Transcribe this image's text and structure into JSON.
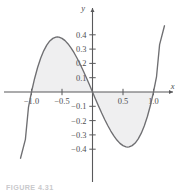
{
  "figure": {
    "caption": "FIGURE 4.31",
    "axis_labels": {
      "x": "x",
      "y": "y"
    },
    "colors": {
      "curve": "#6f6f72",
      "axis": "#59595b",
      "fill": "#efeff0",
      "text": "#4e4e50",
      "background": "#ffffff"
    }
  },
  "chart_data": {
    "type": "line",
    "title": "",
    "xlabel": "x",
    "ylabel": "y",
    "grid": false,
    "legend": null,
    "xlim": [
      -1.18,
      1.18
    ],
    "ylim": [
      -0.52,
      0.5
    ],
    "xticks": [
      -1.0,
      -0.5,
      0.5,
      1.0
    ],
    "xtick_labels": [
      "−1.0",
      "−0.5",
      "0.5",
      "1.0"
    ],
    "yticks": [
      0.4,
      0.3,
      0.2,
      0.1,
      -0.1,
      -0.2,
      -0.3,
      -0.4
    ],
    "ytick_labels": [
      "0.4",
      "0.3",
      "0.2",
      "0.1",
      "−0.1",
      "−0.2",
      "−0.3",
      "−0.4"
    ],
    "series": [
      {
        "name": "y = x³ − x",
        "expression": "x^3 - x",
        "x": [
          -1.18,
          -1.1,
          -1.05,
          -1.0,
          -0.95,
          -0.9,
          -0.85,
          -0.8,
          -0.75,
          -0.7,
          -0.65,
          -0.6,
          -0.577,
          -0.55,
          -0.5,
          -0.45,
          -0.4,
          -0.35,
          -0.3,
          -0.25,
          -0.2,
          -0.15,
          -0.1,
          -0.05,
          0.0,
          0.05,
          0.1,
          0.15,
          0.2,
          0.25,
          0.3,
          0.35,
          0.4,
          0.45,
          0.5,
          0.55,
          0.577,
          0.6,
          0.65,
          0.7,
          0.75,
          0.8,
          0.85,
          0.9,
          0.95,
          1.0,
          1.05,
          1.1,
          1.18
        ],
        "y": [
          -0.463,
          -0.331,
          -0.108,
          0.0,
          0.093,
          0.171,
          0.236,
          0.288,
          0.328,
          0.357,
          0.375,
          0.384,
          0.385,
          0.384,
          0.375,
          0.359,
          0.336,
          0.307,
          0.273,
          0.234,
          0.192,
          0.147,
          0.099,
          0.05,
          0.0,
          -0.05,
          -0.099,
          -0.147,
          -0.192,
          -0.234,
          -0.273,
          -0.307,
          -0.336,
          -0.359,
          -0.375,
          -0.384,
          -0.385,
          -0.384,
          -0.375,
          -0.357,
          -0.328,
          -0.288,
          -0.236,
          -0.171,
          -0.093,
          0.0,
          0.108,
          0.331,
          0.463
        ]
      }
    ],
    "shaded_regions": [
      {
        "name": "left-lobe-above-axis",
        "x_from": -1.0,
        "x_to": 0.0,
        "between": "curve-and-x-axis",
        "sign": "positive"
      },
      {
        "name": "right-lobe-below-axis",
        "x_from": 0.0,
        "x_to": 1.0,
        "between": "curve-and-x-axis",
        "sign": "negative"
      }
    ],
    "annotations": [
      {
        "text": "y",
        "kind": "axis-name",
        "position": "top-of-y-axis"
      },
      {
        "text": "x",
        "kind": "axis-name",
        "position": "right-of-x-axis"
      }
    ]
  }
}
